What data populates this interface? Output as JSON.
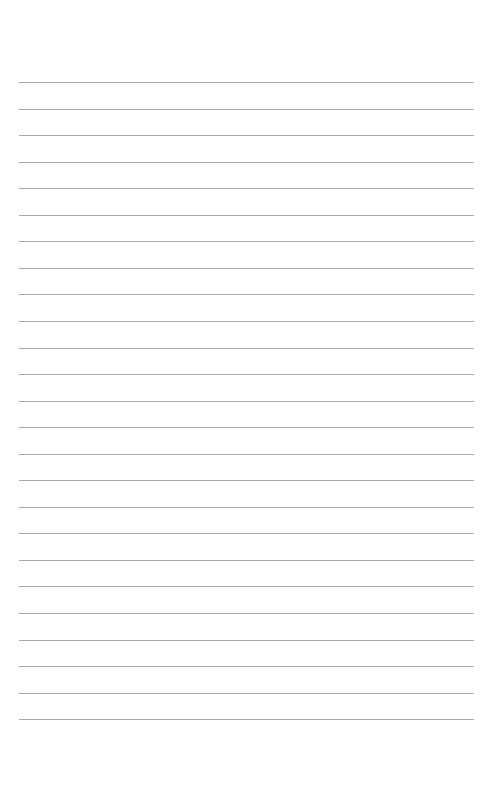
{
  "page": {
    "type": "lined-paper",
    "background_color": "#ffffff",
    "line_color": "#a8a8a8",
    "line_count": 25,
    "first_line_y": 82,
    "line_spacing": 26.55,
    "line_left": 19,
    "line_width": 455
  }
}
